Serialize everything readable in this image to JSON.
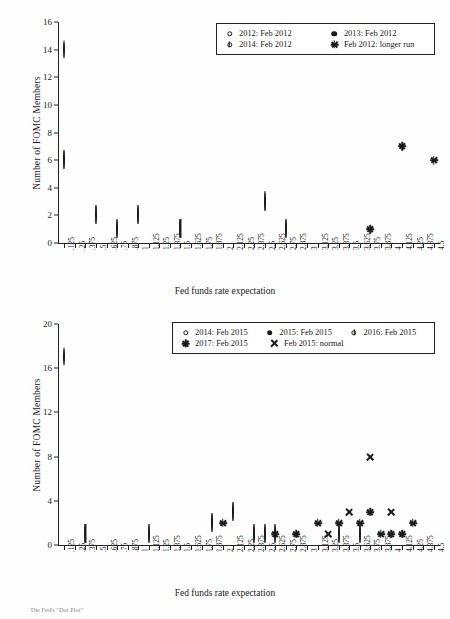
{
  "axes": {
    "ylabel": "Number of FOMC Members",
    "xlabel": "Fed funds rate expectation"
  },
  "caption": "The Fed's \"Dot Plot\"",
  "xticks": [
    ".125",
    ".25",
    ".375",
    ".5",
    ".625",
    ".75",
    ".875",
    "1",
    "1.125",
    "1.25",
    "1.375",
    "1.5",
    "1.625",
    "1.75",
    "1.875",
    "2",
    "2.125",
    "2.25",
    "2.375",
    "2.5",
    "2.625",
    "2.75",
    "2.875",
    "3",
    "3.125",
    "3.25",
    "3.375",
    "3.5",
    "3.625",
    "3.75",
    "3.875",
    "4",
    "4.125",
    "4.25",
    "4.375",
    "4.5"
  ],
  "chart_data": [
    {
      "type": "scatter",
      "title": "",
      "xlabel": "Fed funds rate expectation",
      "ylabel": "Number of FOMC Members",
      "ylim": [
        0,
        16
      ],
      "yticks": [
        "0",
        "2",
        "4",
        "6",
        "8",
        "10",
        "12",
        "14",
        "16"
      ],
      "xlim": [
        ".125",
        "4.5"
      ],
      "grid": false,
      "legend_position": "top-right",
      "legend": [
        {
          "label": "2012: Feb 2012",
          "marker": "open-circle"
        },
        {
          "label": "2013: Feb 2012",
          "marker": "filled-circle"
        },
        {
          "label": "2014: Feb 2012",
          "marker": "barred-circle"
        },
        {
          "label": "Feb 2012: longer run",
          "marker": "asterisk"
        }
      ],
      "series": [
        {
          "name": "2012: Feb 2012",
          "marker": "open-circle",
          "points": [
            {
              "x": ".125",
              "y": 14
            }
          ]
        },
        {
          "name": "2013: Feb 2012",
          "marker": "filled-circle",
          "points": [
            {
              "x": ".125",
              "y": 11
            },
            {
              "x": ".5",
              "y": 1
            },
            {
              "x": ".75",
              "y": 2
            },
            {
              "x": "1",
              "y": 1
            },
            {
              "x": "1.75",
              "y": 1
            }
          ]
        },
        {
          "name": "2014: Feb 2012",
          "marker": "barred-circle",
          "points": [
            {
              "x": ".125",
              "y": 6
            },
            {
              "x": ".5",
              "y": 2
            },
            {
              "x": ".75",
              "y": 1
            },
            {
              "x": "1",
              "y": 2
            },
            {
              "x": "1.5",
              "y": 1
            },
            {
              "x": "2.5",
              "y": 3
            },
            {
              "x": "2.75",
              "y": 1
            }
          ]
        },
        {
          "name": "Feb 2012: longer run",
          "marker": "asterisk",
          "points": [
            {
              "x": "3.75",
              "y": 1
            },
            {
              "x": "4.125",
              "y": 7
            },
            {
              "x": "4.5",
              "y": 6
            }
          ]
        }
      ]
    },
    {
      "type": "scatter",
      "title": "",
      "xlabel": "Fed funds rate expectation",
      "ylabel": "Number of FOMC Members",
      "ylim": [
        0,
        20
      ],
      "yticks": [
        "0",
        "4",
        "8",
        "12",
        "16",
        "20"
      ],
      "xlim": [
        ".125",
        "4.5"
      ],
      "grid": false,
      "legend_position": "top-right",
      "legend": [
        {
          "label": "2014: Feb 2015",
          "marker": "open-circle"
        },
        {
          "label": "2015: Feb 2015",
          "marker": "filled-circle"
        },
        {
          "label": "2016: Feb 2015",
          "marker": "barred-circle"
        },
        {
          "label": "2017: Feb 2015",
          "marker": "asterisk"
        },
        {
          "label": "Feb 2015: normal",
          "marker": "cross"
        }
      ],
      "series": [
        {
          "name": "2014: Feb 2015",
          "marker": "open-circle",
          "points": [
            {
              "x": ".125",
              "y": 17
            }
          ]
        },
        {
          "name": "2015: Feb 2015",
          "marker": "filled-circle",
          "points": [
            {
              "x": ".125",
              "y": 2
            },
            {
              "x": ".625",
              "y": 2
            },
            {
              "x": ".875",
              "y": 4
            },
            {
              "x": "1.125",
              "y": 3
            },
            {
              "x": "1.625",
              "y": 2
            },
            {
              "x": "1.875",
              "y": 4
            }
          ]
        },
        {
          "name": "2016: Feb 2015",
          "marker": "barred-circle",
          "points": [
            {
              "x": ".375",
              "y": 1
            },
            {
              "x": "1.125",
              "y": 1
            },
            {
              "x": "1.875",
              "y": 2
            },
            {
              "x": "2.125",
              "y": 3
            },
            {
              "x": "2.375",
              "y": 1
            },
            {
              "x": "2.5",
              "y": 1
            },
            {
              "x": "2.625",
              "y": 1
            },
            {
              "x": "3.375",
              "y": 1
            },
            {
              "x": "3.625",
              "y": 1
            }
          ]
        },
        {
          "name": "2017: Feb 2015",
          "marker": "asterisk",
          "points": [
            {
              "x": "2",
              "y": 2
            },
            {
              "x": "2.625",
              "y": 1
            },
            {
              "x": "2.875",
              "y": 1
            },
            {
              "x": "3.125",
              "y": 2
            },
            {
              "x": "3.375",
              "y": 2
            },
            {
              "x": "3.625",
              "y": 2
            },
            {
              "x": "3.75",
              "y": 3
            },
            {
              "x": "3.875",
              "y": 1
            },
            {
              "x": "4",
              "y": 1
            },
            {
              "x": "4.125",
              "y": 1
            },
            {
              "x": "4.25",
              "y": 2
            }
          ]
        },
        {
          "name": "Feb 2015: normal",
          "marker": "cross",
          "points": [
            {
              "x": "3.25",
              "y": 1
            },
            {
              "x": "3.5",
              "y": 3
            },
            {
              "x": "3.75",
              "y": 8
            },
            {
              "x": "4",
              "y": 3
            }
          ]
        }
      ]
    }
  ]
}
